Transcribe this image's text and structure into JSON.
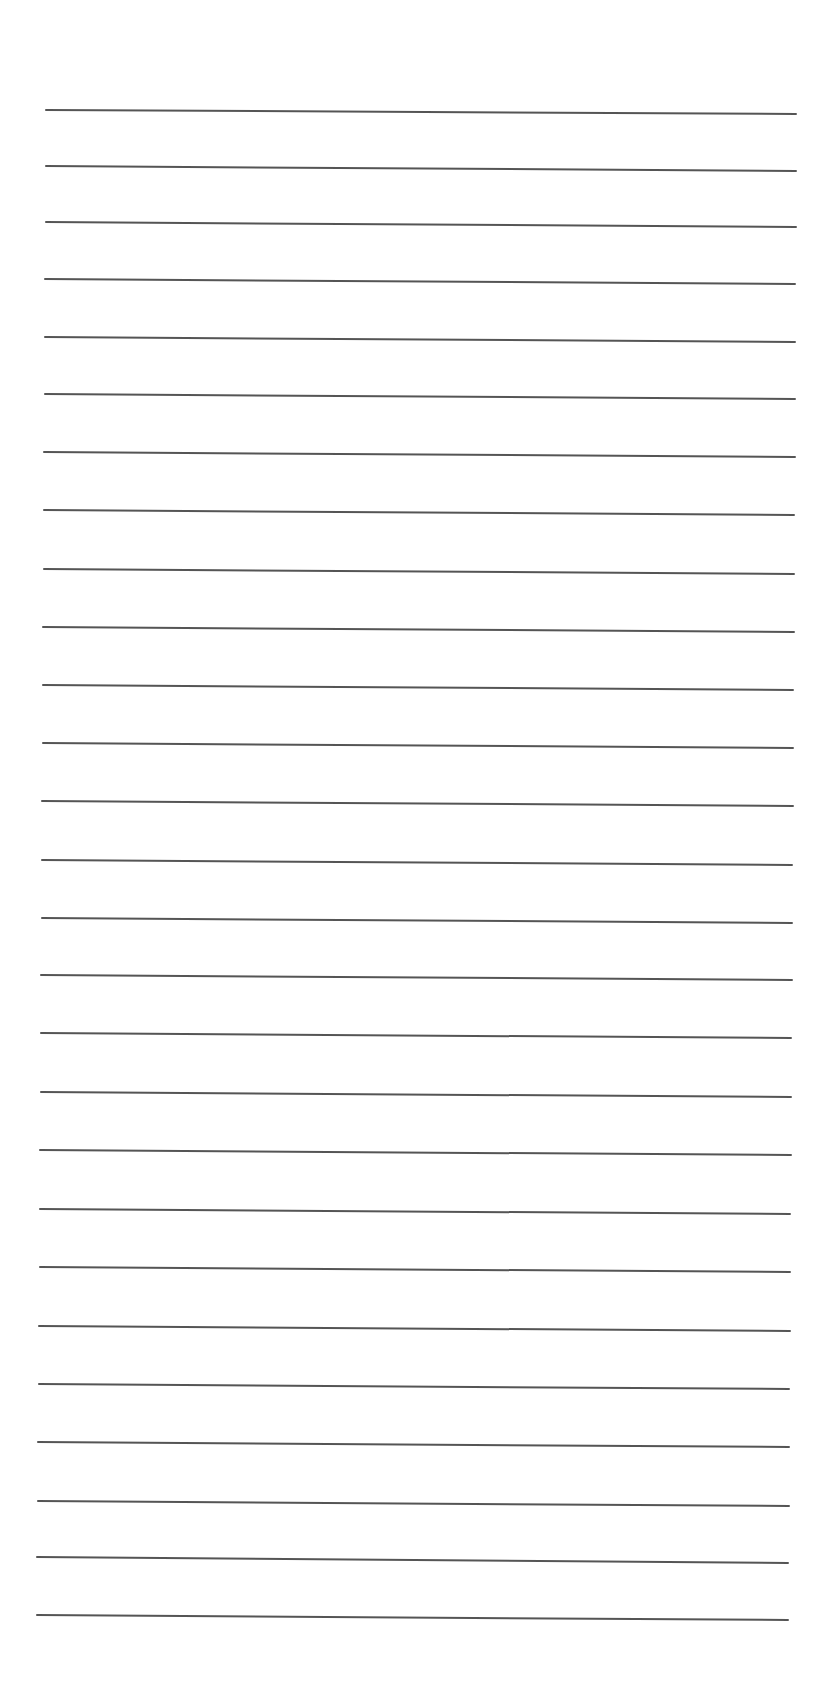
{
  "page": {
    "type": "lined-paper",
    "background_color": "#ffffff",
    "line_color": "#555555",
    "line_thickness_px": 2,
    "line_count": 27,
    "bleed_through_text": ""
  },
  "lines": [
    {
      "x1": 46,
      "y1": 110,
      "x2": 796,
      "y2": 114
    },
    {
      "x1": 46,
      "y1": 166,
      "x2": 796,
      "y2": 171
    },
    {
      "x1": 46,
      "y1": 222,
      "x2": 796,
      "y2": 227
    },
    {
      "x1": 45,
      "y1": 279,
      "x2": 795,
      "y2": 284
    },
    {
      "x1": 45,
      "y1": 337,
      "x2": 795,
      "y2": 342
    },
    {
      "x1": 45,
      "y1": 394,
      "x2": 795,
      "y2": 399
    },
    {
      "x1": 44,
      "y1": 452,
      "x2": 795,
      "y2": 457
    },
    {
      "x1": 44,
      "y1": 510,
      "x2": 794,
      "y2": 515
    },
    {
      "x1": 44,
      "y1": 569,
      "x2": 794,
      "y2": 574
    },
    {
      "x1": 43,
      "y1": 627,
      "x2": 794,
      "y2": 632
    },
    {
      "x1": 43,
      "y1": 685,
      "x2": 793,
      "y2": 690
    },
    {
      "x1": 43,
      "y1": 743,
      "x2": 793,
      "y2": 748
    },
    {
      "x1": 42,
      "y1": 801,
      "x2": 793,
      "y2": 806
    },
    {
      "x1": 42,
      "y1": 860,
      "x2": 792,
      "y2": 865
    },
    {
      "x1": 42,
      "y1": 918,
      "x2": 792,
      "y2": 923
    },
    {
      "x1": 41,
      "y1": 975,
      "x2": 792,
      "y2": 980
    },
    {
      "x1": 41,
      "y1": 1033,
      "x2": 791,
      "y2": 1038
    },
    {
      "x1": 41,
      "y1": 1092,
      "x2": 791,
      "y2": 1097
    },
    {
      "x1": 40,
      "y1": 1150,
      "x2": 791,
      "y2": 1155
    },
    {
      "x1": 40,
      "y1": 1209,
      "x2": 790,
      "y2": 1214
    },
    {
      "x1": 40,
      "y1": 1267,
      "x2": 790,
      "y2": 1272
    },
    {
      "x1": 39,
      "y1": 1326,
      "x2": 790,
      "y2": 1331
    },
    {
      "x1": 39,
      "y1": 1384,
      "x2": 789,
      "y2": 1389
    },
    {
      "x1": 38,
      "y1": 1442,
      "x2": 789,
      "y2": 1447
    },
    {
      "x1": 38,
      "y1": 1501,
      "x2": 789,
      "y2": 1506
    },
    {
      "x1": 37,
      "y1": 1557,
      "x2": 788,
      "y2": 1563
    },
    {
      "x1": 37,
      "y1": 1615,
      "x2": 788,
      "y2": 1620
    }
  ]
}
